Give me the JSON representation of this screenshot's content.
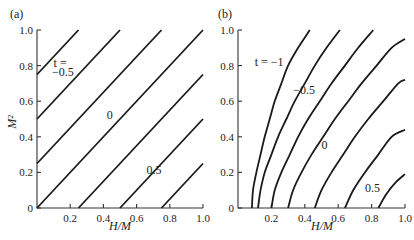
{
  "chart_data": [
    {
      "type": "line",
      "panel_label": "(a)",
      "xlabel": "H/M",
      "ylabel": "M²",
      "xlim": [
        0,
        1.0
      ],
      "ylim": [
        0,
        1.0
      ],
      "x_ticks": [
        "0.2",
        "0.4",
        "0.6",
        "0.8",
        "1.0"
      ],
      "y_ticks": [
        "0",
        "0.2",
        "0.4",
        "0.6",
        "0.8",
        "1.0"
      ],
      "grid": false,
      "series": [
        {
          "name": "t = -0.5",
          "points": [
            [
              0,
              0.75
            ],
            [
              0.25,
              1.0
            ]
          ]
        },
        {
          "name": "t = -0.25",
          "points": [
            [
              0,
              0.5
            ],
            [
              0.5,
              1.0
            ]
          ]
        },
        {
          "name": "t = -0.125",
          "points": [
            [
              0,
              0.25
            ],
            [
              0.75,
              1.0
            ]
          ]
        },
        {
          "name": "t = 0",
          "points": [
            [
              0,
              0
            ],
            [
              1.0,
              1.0
            ]
          ]
        },
        {
          "name": "t = 0.25",
          "points": [
            [
              0.25,
              0
            ],
            [
              1.0,
              0.75
            ]
          ]
        },
        {
          "name": "t = 0.5",
          "points": [
            [
              0.5,
              0
            ],
            [
              1.0,
              0.5
            ]
          ]
        },
        {
          "name": "t = 0.75",
          "points": [
            [
              0.75,
              0
            ],
            [
              1.0,
              0.25
            ]
          ]
        }
      ],
      "annotations": [
        {
          "text": "t =",
          "x": 0.1,
          "y": 0.79,
          "italic_first": true
        },
        {
          "text": "−0.5",
          "x": 0.09,
          "y": 0.74
        },
        {
          "text": "0",
          "x": 0.42,
          "y": 0.5
        },
        {
          "text": "0.5",
          "x": 0.66,
          "y": 0.19
        }
      ]
    },
    {
      "type": "line",
      "panel_label": "(b)",
      "xlabel": "H/M",
      "ylabel": "",
      "xlim": [
        0,
        1.0
      ],
      "ylim": [
        0,
        1.0
      ],
      "x_ticks": [
        "0.2",
        "0.4",
        "0.6",
        "0.8",
        "1.0"
      ],
      "y_ticks": [
        "0",
        "0.2",
        "0.4",
        "0.6",
        "0.8",
        "1.0"
      ],
      "grid": false,
      "series": [
        {
          "name": "t = -1",
          "points": [
            [
              0.083,
              0
            ],
            [
              0.09,
              0.1
            ],
            [
              0.11,
              0.2
            ],
            [
              0.135,
              0.3
            ],
            [
              0.16,
              0.4
            ],
            [
              0.19,
              0.5
            ],
            [
              0.22,
              0.6
            ],
            [
              0.26,
              0.7
            ],
            [
              0.3,
              0.8
            ],
            [
              0.36,
              0.9
            ],
            [
              0.43,
              1.0
            ]
          ]
        },
        {
          "name": "t = -0.75",
          "points": [
            [
              0.12,
              0
            ],
            [
              0.135,
              0.1
            ],
            [
              0.16,
              0.2
            ],
            [
              0.2,
              0.3
            ],
            [
              0.24,
              0.4
            ],
            [
              0.29,
              0.5
            ],
            [
              0.34,
              0.6
            ],
            [
              0.4,
              0.7
            ],
            [
              0.46,
              0.8
            ],
            [
              0.53,
              0.9
            ],
            [
              0.61,
              1.0
            ]
          ]
        },
        {
          "name": "t = -0.5",
          "points": [
            [
              0.2,
              0
            ],
            [
              0.22,
              0.1
            ],
            [
              0.26,
              0.2
            ],
            [
              0.31,
              0.3
            ],
            [
              0.36,
              0.4
            ],
            [
              0.42,
              0.5
            ],
            [
              0.49,
              0.6
            ],
            [
              0.56,
              0.7
            ],
            [
              0.64,
              0.8
            ],
            [
              0.72,
              0.9
            ],
            [
              0.81,
              1.0
            ]
          ]
        },
        {
          "name": "t = -0.25",
          "points": [
            [
              0.3,
              0
            ],
            [
              0.33,
              0.1
            ],
            [
              0.38,
              0.2
            ],
            [
              0.44,
              0.3
            ],
            [
              0.51,
              0.4
            ],
            [
              0.58,
              0.5
            ],
            [
              0.66,
              0.6
            ],
            [
              0.74,
              0.7
            ],
            [
              0.83,
              0.8
            ],
            [
              0.92,
              0.9
            ],
            [
              1.0,
              0.95
            ]
          ]
        },
        {
          "name": "t = 0",
          "points": [
            [
              0.46,
              0
            ],
            [
              0.5,
              0.1
            ],
            [
              0.56,
              0.2
            ],
            [
              0.63,
              0.3
            ],
            [
              0.7,
              0.4
            ],
            [
              0.78,
              0.5
            ],
            [
              0.87,
              0.6
            ],
            [
              0.96,
              0.7
            ],
            [
              1.0,
              0.72
            ]
          ]
        },
        {
          "name": "t = 0.25",
          "points": [
            [
              0.64,
              0
            ],
            [
              0.69,
              0.1
            ],
            [
              0.76,
              0.2
            ],
            [
              0.84,
              0.3
            ],
            [
              0.92,
              0.4
            ],
            [
              1.0,
              0.44
            ]
          ]
        },
        {
          "name": "t = 0.5",
          "points": [
            [
              0.84,
              0
            ],
            [
              0.89,
              0.08
            ],
            [
              0.94,
              0.14
            ],
            [
              1.0,
              0.19
            ]
          ]
        }
      ],
      "annotations": [
        {
          "text": "t = −1",
          "x": 0.1,
          "y": 0.8
        },
        {
          "text": "−0.5",
          "x": 0.33,
          "y": 0.64
        },
        {
          "text": "0",
          "x": 0.5,
          "y": 0.33
        },
        {
          "text": "0.5",
          "x": 0.76,
          "y": 0.09
        }
      ]
    }
  ]
}
